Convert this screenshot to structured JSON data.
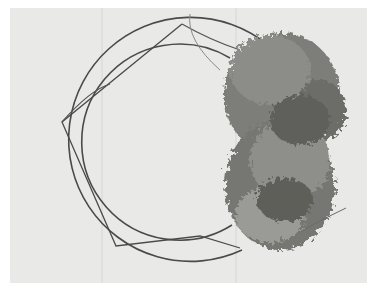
{
  "image": {
    "subject": "wire wreath frame partially covered with moss",
    "palette": {
      "border": "#ffffff",
      "background": "#e9e9e7",
      "plank_seam": "#d6d6d3",
      "wire": "#4a4a4a",
      "moss_dark": "#5a5a58",
      "moss_mid": "#8a8a86",
      "moss_light": "#b4b4b0"
    }
  }
}
